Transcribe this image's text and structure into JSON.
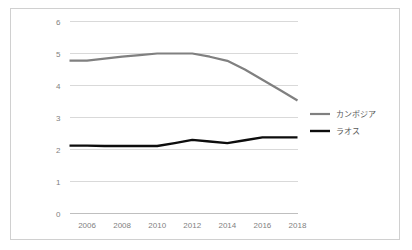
{
  "chart_data": {
    "type": "line",
    "title": "",
    "xlabel": "",
    "ylabel": "",
    "x": [
      2005,
      2006,
      2007,
      2008,
      2009,
      2010,
      2011,
      2012,
      2013,
      2014,
      2015,
      2016,
      2017,
      2018
    ],
    "xlim": [
      2005,
      2018
    ],
    "ylim": [
      0,
      6
    ],
    "ytick_labels": [
      "0",
      "1",
      "2",
      "3",
      "4",
      "5",
      "6"
    ],
    "ytick_values": [
      0,
      1,
      2,
      3,
      4,
      5,
      6
    ],
    "xtick_labels": [
      "2006",
      "2008",
      "2010",
      "2012",
      "2014",
      "2016",
      "2018"
    ],
    "xtick_values": [
      2006,
      2008,
      2010,
      2012,
      2014,
      2016,
      2018
    ],
    "grid": true,
    "legend_position": "right",
    "series": [
      {
        "name": "カンボジア",
        "color": "#808080",
        "width": 2.2,
        "values": [
          4.78,
          4.78,
          4.84,
          4.9,
          4.95,
          5.0,
          5.0,
          5.0,
          4.9,
          4.77,
          4.5,
          4.18,
          3.86,
          3.53
        ]
      },
      {
        "name": "ラオス",
        "color": "#0d0d0d",
        "width": 2.4,
        "values": [
          2.12,
          2.12,
          2.11,
          2.11,
          2.11,
          2.11,
          2.2,
          2.3,
          2.25,
          2.2,
          2.29,
          2.38,
          2.38,
          2.38
        ]
      }
    ]
  },
  "legend": {
    "entries": [
      {
        "label": "カンボジア",
        "color": "#808080"
      },
      {
        "label": "ラオス",
        "color": "#0d0d0d"
      }
    ]
  },
  "frame": {
    "border_color": "#d0d0d0",
    "background": "#ffffff"
  }
}
